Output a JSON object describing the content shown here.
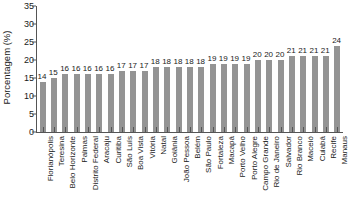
{
  "chart_data": {
    "type": "bar",
    "title": "",
    "subtitle": "",
    "xlabel": "",
    "ylabel": "Porcentagem (%)",
    "ylim": [
      0,
      35
    ],
    "ytick_values": [
      0,
      5,
      10,
      15,
      20,
      25,
      30,
      35
    ],
    "ytick_labels": [
      "0",
      "5",
      "10",
      "15",
      "20",
      "25",
      "30",
      "35"
    ],
    "grid": false,
    "legend": null,
    "bar_color": "#949494",
    "axis_color": "#555555",
    "categories": [
      "Florianópolis",
      "Teresina",
      "Belo Horizonte",
      "Palmas",
      "Distrito Federal",
      "Aracaju",
      "Curitiba",
      "São Luís",
      "Boa Vista",
      "Vitória",
      "Natal",
      "Goiânia",
      "João Pessoa",
      "Belém",
      "São Paulo",
      "Fortaleza",
      "Macapá",
      "Porto Velho",
      "Porto Alegre",
      "Campo Grande",
      "Rio de Janeiro",
      "Salvador",
      "Rio Branco",
      "Maceió",
      "Cuiabá",
      "Recife",
      "Manaus"
    ],
    "values": [
      14,
      15,
      16,
      16,
      16,
      16,
      16,
      17,
      17,
      17,
      18,
      18,
      18,
      18,
      18,
      19,
      19,
      19,
      19,
      20,
      20,
      20,
      21,
      21,
      21,
      21,
      24
    ],
    "data_labels": [
      "14",
      "15",
      "16",
      "16",
      "16",
      "16",
      "16",
      "17",
      "17",
      "17",
      "18",
      "18",
      "18",
      "18",
      "18",
      "19",
      "19",
      "19",
      "19",
      "20",
      "20",
      "20",
      "21",
      "21",
      "21",
      "21",
      "24"
    ]
  }
}
